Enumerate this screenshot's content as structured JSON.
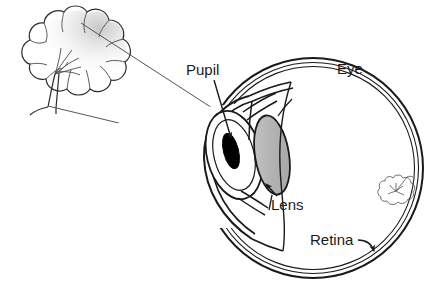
{
  "figure": {
    "background_color": "#ffffff",
    "ink_color": "#1a1a1a",
    "ray_color": "#555555"
  },
  "labels": {
    "pupil": "Pupil",
    "lens": "Lens",
    "eye": "Eye",
    "retina": "Retina"
  },
  "parts": {
    "pupil": {
      "name": "pupil",
      "color": "#000000"
    },
    "lens": {
      "name": "lens",
      "color": "#b9b9b9"
    },
    "eyeball": {
      "name": "eyeball",
      "color": "#ffffff"
    },
    "retina": {
      "name": "retina",
      "color": "#ffffff"
    },
    "cornea": {
      "name": "cornea",
      "color": "#ffffff"
    },
    "iris": {
      "name": "iris",
      "color": "#ffffff"
    },
    "object_tree": {
      "name": "tree-object",
      "color": "#ffffff"
    },
    "image_tree": {
      "name": "inverted-tree-image",
      "color": "#ffffff"
    }
  },
  "rays": {
    "count": 2,
    "description": "light rays from top and bottom of tree crossing at the lens",
    "color": "#555555"
  }
}
